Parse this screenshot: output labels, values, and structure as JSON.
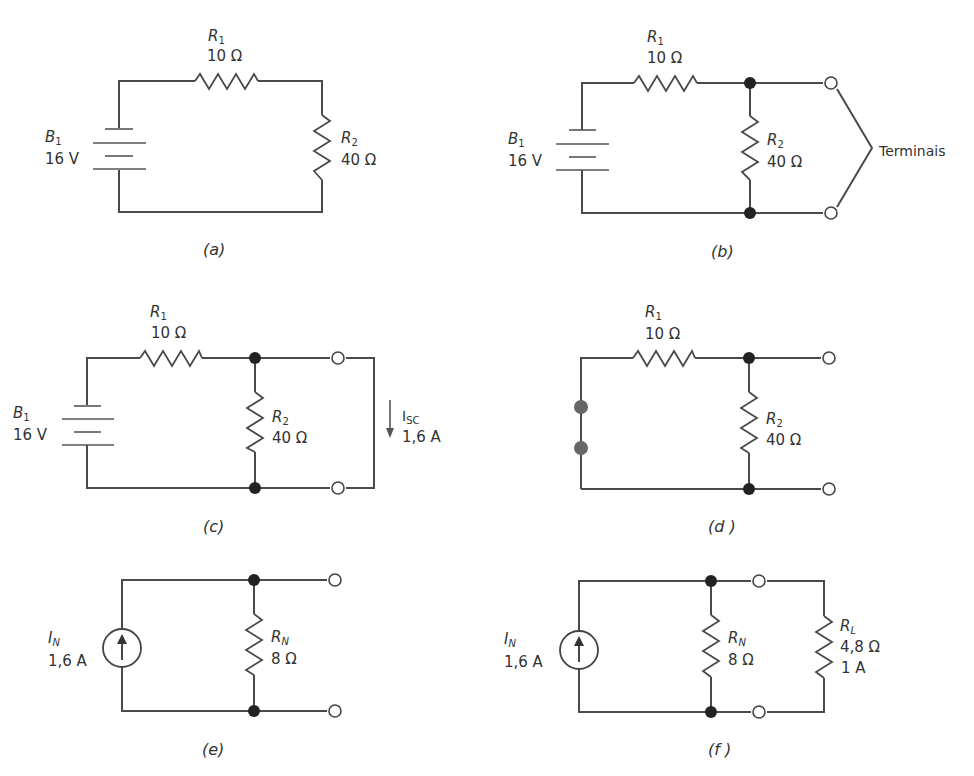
{
  "figure": {
    "panels": [
      {
        "id": "a",
        "caption": "(a)",
        "components": [
          {
            "type": "battery",
            "name": "B",
            "sub": "1",
            "value": "16 V"
          },
          {
            "type": "resistor",
            "name": "R",
            "sub": "1",
            "value": "10 Ω"
          },
          {
            "type": "resistor",
            "name": "R",
            "sub": "2",
            "value": "40 Ω"
          }
        ]
      },
      {
        "id": "b",
        "caption": "(b)",
        "components": [
          {
            "type": "battery",
            "name": "B",
            "sub": "1",
            "value": "16 V"
          },
          {
            "type": "resistor",
            "name": "R",
            "sub": "1",
            "value": "10 Ω"
          },
          {
            "type": "resistor",
            "name": "R",
            "sub": "2",
            "value": "40 Ω"
          }
        ],
        "annotation": "Terminais"
      },
      {
        "id": "c",
        "caption": "(c)",
        "components": [
          {
            "type": "battery",
            "name": "B",
            "sub": "1",
            "value": "16 V"
          },
          {
            "type": "resistor",
            "name": "R",
            "sub": "1",
            "value": "10 Ω"
          },
          {
            "type": "resistor",
            "name": "R",
            "sub": "2",
            "value": "40 Ω"
          }
        ],
        "current": {
          "name": "I",
          "sub": "SC",
          "value": "1,6 A"
        }
      },
      {
        "id": "d",
        "caption": "(d )",
        "components": [
          {
            "type": "resistor",
            "name": "R",
            "sub": "1",
            "value": "10 Ω"
          },
          {
            "type": "resistor",
            "name": "R",
            "sub": "2",
            "value": "40 Ω"
          }
        ]
      },
      {
        "id": "e",
        "caption": "(e)",
        "components": [
          {
            "type": "current-source",
            "name": "I",
            "sub": "N",
            "value": "1,6 A"
          },
          {
            "type": "resistor",
            "name": "R",
            "sub": "N",
            "value": "8 Ω"
          }
        ]
      },
      {
        "id": "f",
        "caption": "(f )",
        "components": [
          {
            "type": "current-source",
            "name": "I",
            "sub": "N",
            "value": "1,6 A"
          },
          {
            "type": "resistor",
            "name": "R",
            "sub": "N",
            "value": "8 Ω"
          },
          {
            "type": "resistor",
            "name": "R",
            "sub": "L",
            "value": "4,8 Ω",
            "current": "1 A"
          }
        ]
      }
    ]
  }
}
